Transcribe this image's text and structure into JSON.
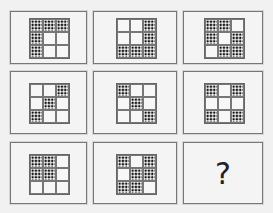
{
  "puzzle": {
    "description": "3x3 matrix of 3x3 grids; dotted cells marked 1",
    "panels": [
      {
        "id": 1,
        "cells": [
          1,
          1,
          1,
          1,
          0,
          0,
          1,
          0,
          0
        ]
      },
      {
        "id": 2,
        "cells": [
          0,
          0,
          1,
          0,
          0,
          1,
          1,
          1,
          1
        ]
      },
      {
        "id": 3,
        "cells": [
          1,
          1,
          0,
          1,
          0,
          1,
          0,
          1,
          1
        ]
      },
      {
        "id": 4,
        "cells": [
          0,
          0,
          1,
          0,
          1,
          0,
          1,
          0,
          0
        ]
      },
      {
        "id": 5,
        "cells": [
          1,
          0,
          0,
          0,
          1,
          0,
          0,
          0,
          1
        ]
      },
      {
        "id": 6,
        "cells": [
          1,
          0,
          1,
          0,
          0,
          0,
          1,
          0,
          1
        ]
      },
      {
        "id": 7,
        "cells": [
          1,
          1,
          0,
          1,
          1,
          0,
          0,
          0,
          0
        ]
      },
      {
        "id": 8,
        "cells": [
          1,
          0,
          1,
          0,
          1,
          1,
          1,
          1,
          0
        ]
      },
      {
        "id": 9,
        "question": "?"
      }
    ]
  },
  "colors": {
    "background": "#f1f1f1",
    "border": "#777777",
    "dot": "#111111"
  }
}
